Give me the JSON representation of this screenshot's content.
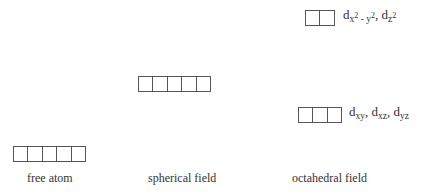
{
  "diagram": {
    "columns": [
      {
        "id": "free-atom",
        "caption": "free atom",
        "levels": [
          {
            "boxes": 5,
            "label": ""
          }
        ]
      },
      {
        "id": "spherical-field",
        "caption": "spherical field",
        "levels": [
          {
            "boxes": 5,
            "label": ""
          }
        ]
      },
      {
        "id": "octahedral-field",
        "caption": "octahedral field",
        "levels": [
          {
            "boxes": 2,
            "label": "d_x2-y2, d_z2",
            "parts": {
              "d1": "d",
              "s1": "x",
              "p1": "2",
              "m": " - ",
              "s2": "y",
              "p2": "2",
              "c": ", d",
              "s3": "z",
              "p3": "2"
            }
          },
          {
            "boxes": 3,
            "label": "d_xy, d_xz, d_yz",
            "parts": {
              "d1": "d",
              "s1": "xy",
              "c1": ", d",
              "s2": "xz",
              "c2": ", d",
              "s3": "yz"
            }
          }
        ]
      }
    ]
  },
  "captions": {
    "free_atom": "free atom",
    "spherical": "spherical field",
    "octahedral": "octahedral field"
  }
}
